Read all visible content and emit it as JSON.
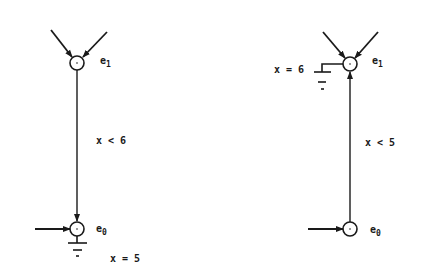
{
  "diagram": {
    "colors": {
      "stroke": "#1a1a1a",
      "background": "#ffffff"
    },
    "left": {
      "top_node": {
        "label": "e",
        "subscript": "1"
      },
      "bottom_node": {
        "label": "e",
        "subscript": "0"
      },
      "edge_label": "x < 6",
      "ground_label": "x = 5"
    },
    "right": {
      "top_node": {
        "label": "e",
        "subscript": "1"
      },
      "bottom_node": {
        "label": "e",
        "subscript": "0"
      },
      "edge_label": "x < 5",
      "ground_label": "x = 6"
    }
  }
}
